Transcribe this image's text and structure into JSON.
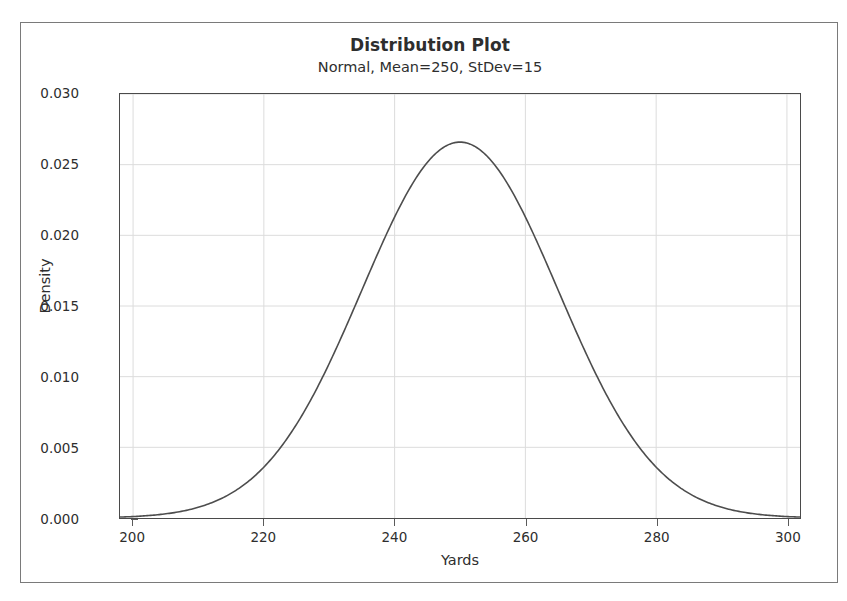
{
  "chart_data": {
    "type": "line",
    "title": "Distribution Plot",
    "subtitle": "Normal, Mean=250, StDev=15",
    "xlabel": "Yards",
    "ylabel": "Density",
    "xlim": [
      198,
      302
    ],
    "ylim": [
      0.0,
      0.03
    ],
    "xticks": [
      200,
      220,
      240,
      260,
      280,
      300
    ],
    "xtick_labels": [
      "200",
      "220",
      "240",
      "260",
      "280",
      "300"
    ],
    "yticks": [
      0.0,
      0.005,
      0.01,
      0.015,
      0.02,
      0.025,
      0.03
    ],
    "ytick_labels": [
      "0.000",
      "0.005",
      "0.010",
      "0.015",
      "0.020",
      "0.025",
      "0.030"
    ],
    "grid": true,
    "legend": "none",
    "distribution": {
      "family": "Normal",
      "mean": 250,
      "stdev": 15,
      "peak_density": 0.0266
    },
    "series": [
      {
        "name": "Normal(250,15) density",
        "color": "#4d4d4d",
        "x": [
          198,
          200,
          205,
          210,
          215,
          220,
          225,
          230,
          235,
          240,
          245,
          250,
          255,
          260,
          265,
          270,
          275,
          280,
          285,
          290,
          295,
          300,
          302
        ],
        "y": [
          0.00022,
          0.00033,
          0.00076,
          0.00157,
          0.00295,
          0.00502,
          0.00776,
          0.01087,
          0.01382,
          0.01596,
          0.01702,
          0.02659,
          0.01702,
          0.01596,
          0.01382,
          0.01087,
          0.00776,
          0.00502,
          0.00295,
          0.00157,
          0.00076,
          0.00033,
          0.00022
        ]
      }
    ]
  },
  "colors": {
    "curve": "#4d4d4d",
    "frame": "#4a4a4a",
    "outer_frame": "#7a7a7a",
    "grid": "#dcdcdc",
    "text": "#2e2e2e",
    "background": "#ffffff"
  }
}
